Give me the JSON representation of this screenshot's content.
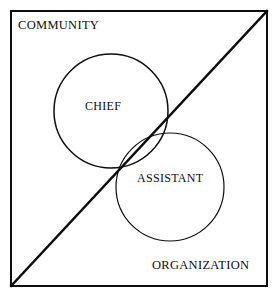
{
  "diagram": {
    "type": "venn-diagram",
    "background_color": "#ffffff",
    "stroke_color": "#0d0d0d",
    "frame": {
      "name": "outer-frame",
      "x": 10,
      "y": 10,
      "width": 258,
      "height": 277,
      "stroke_width": 2
    },
    "divider": {
      "name": "diagonal-divider",
      "description": "diagonal line from bottom-left corner to top-right corner",
      "x1": 10,
      "y1": 287,
      "x2": 268,
      "y2": 10,
      "stroke_width": 2.4
    },
    "regions": [
      {
        "id": "community",
        "label": "COMMUNITY",
        "position": "upper-left"
      },
      {
        "id": "organization",
        "label": "ORGANIZATION",
        "position": "lower-right"
      }
    ],
    "circles": [
      {
        "id": "chief",
        "label": "CHIEF",
        "cx": 111,
        "cy": 111,
        "r": 57,
        "stroke_width": 1.5
      },
      {
        "id": "assistant",
        "label": "ASSISTANT",
        "cx": 170,
        "cy": 187,
        "r": 54,
        "stroke_width": 1.2
      }
    ]
  }
}
